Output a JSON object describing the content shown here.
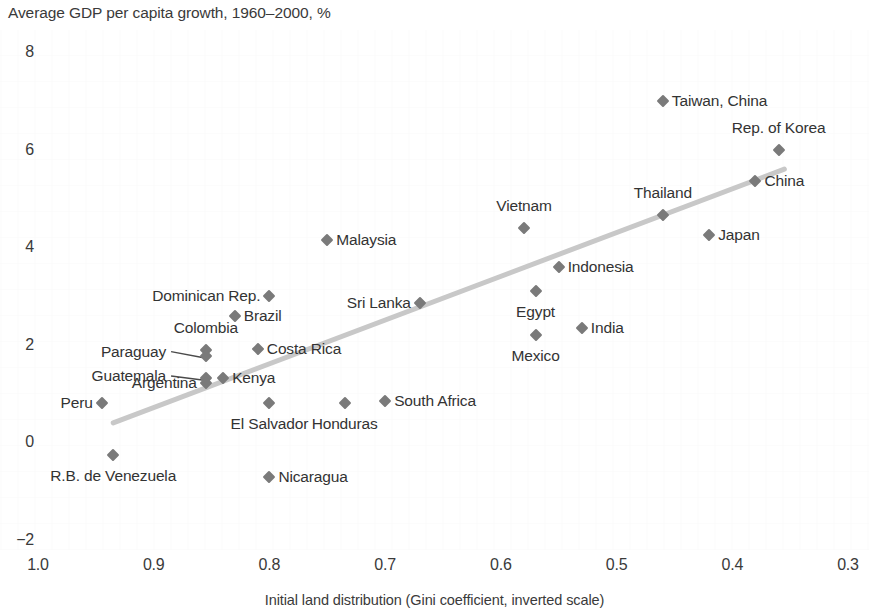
{
  "chart_data": {
    "type": "scatter",
    "title": "Average GDP per capita growth, 1960–2000, %",
    "xlabel": "Initial land distribution (Gini coefficient, inverted scale)",
    "ylabel": "",
    "xlim": [
      1.0,
      0.3
    ],
    "ylim": [
      -2,
      8
    ],
    "x_inverted": true,
    "grid": false,
    "legend": "none",
    "x_ticks": [
      "1.0",
      "0.9",
      "0.8",
      "0.7",
      "0.6",
      "0.5",
      "0.4",
      "0.3"
    ],
    "x_tick_values": [
      1.0,
      0.9,
      0.8,
      0.7,
      0.6,
      0.5,
      0.4,
      0.3
    ],
    "y_ticks": [
      "8",
      "6",
      "4",
      "2",
      "0",
      "−2"
    ],
    "y_tick_values": [
      8,
      6,
      4,
      2,
      0,
      -2
    ],
    "point_label_key": "country",
    "points": [
      {
        "country": "Taiwan, China",
        "x": 0.46,
        "y": 7.0,
        "label_side": "right"
      },
      {
        "country": "Rep. of Korea",
        "x": 0.36,
        "y": 6.0,
        "label_side": "above"
      },
      {
        "country": "China",
        "x": 0.38,
        "y": 5.35,
        "label_side": "right"
      },
      {
        "country": "Thailand",
        "x": 0.46,
        "y": 4.65,
        "label_side": "above"
      },
      {
        "country": "Japan",
        "x": 0.42,
        "y": 4.25,
        "label_side": "right"
      },
      {
        "country": "Vietnam",
        "x": 0.58,
        "y": 4.4,
        "label_side": "above"
      },
      {
        "country": "Malaysia",
        "x": 0.75,
        "y": 4.15,
        "label_side": "right"
      },
      {
        "country": "Indonesia",
        "x": 0.55,
        "y": 3.6,
        "label_side": "right"
      },
      {
        "country": "Egypt",
        "x": 0.57,
        "y": 3.1,
        "label_side": "below"
      },
      {
        "country": "Sri Lanka",
        "x": 0.67,
        "y": 2.85,
        "label_side": "left"
      },
      {
        "country": "Dominican Rep.",
        "x": 0.8,
        "y": 3.0,
        "label_side": "left"
      },
      {
        "country": "Brazil",
        "x": 0.83,
        "y": 2.6,
        "label_side": "right"
      },
      {
        "country": "India",
        "x": 0.53,
        "y": 2.35,
        "label_side": "right"
      },
      {
        "country": "Mexico",
        "x": 0.57,
        "y": 2.2,
        "label_side": "below"
      },
      {
        "country": "Colombia",
        "x": 0.855,
        "y": 1.9,
        "label_side": "above"
      },
      {
        "country": "Paraguay",
        "x": 0.855,
        "y": 1.78,
        "label_side": "leader-left"
      },
      {
        "country": "Costa Rica",
        "x": 0.81,
        "y": 1.92,
        "label_side": "right"
      },
      {
        "country": "Guatemala",
        "x": 0.855,
        "y": 1.32,
        "label_side": "leader-left"
      },
      {
        "country": "Argentina",
        "x": 0.855,
        "y": 1.22,
        "label_side": "left"
      },
      {
        "country": "Kenya",
        "x": 0.84,
        "y": 1.32,
        "label_side": "right"
      },
      {
        "country": "El Salvador",
        "x": 0.8,
        "y": 0.8,
        "label_side": "below"
      },
      {
        "country": "Honduras",
        "x": 0.735,
        "y": 0.8,
        "label_side": "below"
      },
      {
        "country": "South Africa",
        "x": 0.7,
        "y": 0.85,
        "label_side": "right"
      },
      {
        "country": "Peru",
        "x": 0.945,
        "y": 0.8,
        "label_side": "left"
      },
      {
        "country": "R.B. de Venezuela",
        "x": 0.935,
        "y": -0.25,
        "label_side": "below"
      },
      {
        "country": "Nicaragua",
        "x": 0.8,
        "y": -0.7,
        "label_side": "right"
      }
    ],
    "trendline": {
      "name": "fitted trend",
      "x_start": 0.935,
      "y_start": 0.4,
      "x_end": 0.355,
      "y_end": 5.6,
      "color": "#c8c8c8"
    },
    "leader_lines": [
      {
        "from_label": "Paraguay",
        "x1": 0.885,
        "y1": 1.86,
        "x2": 0.858,
        "y2": 1.74
      },
      {
        "from_label": "Guatemala",
        "x1": 0.885,
        "y1": 1.36,
        "x2": 0.858,
        "y2": 1.28
      }
    ],
    "colors": {
      "marker": "#7a7a7a",
      "text": "#333333",
      "trendline": "#c8c8c8",
      "background": "#ffffff"
    }
  }
}
